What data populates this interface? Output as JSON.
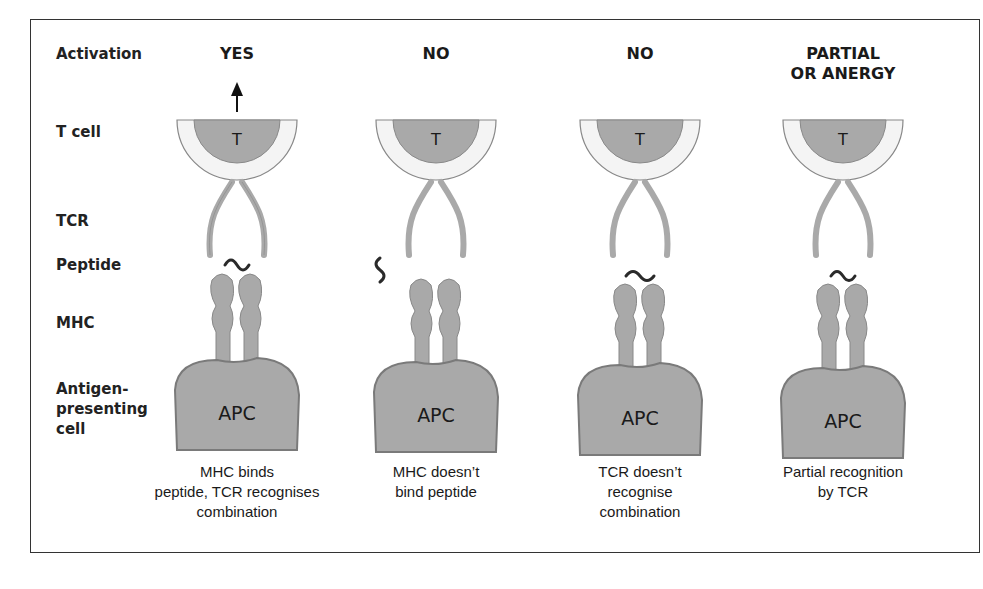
{
  "row_labels": {
    "activation": "Activation",
    "t_cell": "T cell",
    "tcr": "TCR",
    "peptide": "Peptide",
    "mhc": "MHC",
    "apc_line1": "Antigen-",
    "apc_line2": "presenting",
    "apc_line3": "cell"
  },
  "columns": [
    {
      "activation": "YES",
      "activation_line2": "",
      "t_label": "T",
      "apc_label": "APC",
      "caption": [
        "MHC binds",
        "peptide, TCR recognises",
        "combination"
      ]
    },
    {
      "activation": "NO",
      "activation_line2": "",
      "t_label": "T",
      "apc_label": "APC",
      "caption": [
        "MHC doesn’t",
        "bind peptide",
        ""
      ]
    },
    {
      "activation": "NO",
      "activation_line2": "",
      "t_label": "T",
      "apc_label": "APC",
      "caption": [
        "TCR doesn’t",
        "recognise",
        "combination"
      ]
    },
    {
      "activation": "PARTIAL",
      "activation_line2": "OR ANERGY",
      "t_label": "T",
      "apc_label": "APC",
      "caption": [
        "Partial recognition",
        "by TCR",
        ""
      ]
    }
  ],
  "colors": {
    "cell_fill": "#a9a9a9",
    "tcell_outer": "#f4f4f4",
    "outline": "#7a7a7a",
    "peptide": "#2a2a2a"
  }
}
